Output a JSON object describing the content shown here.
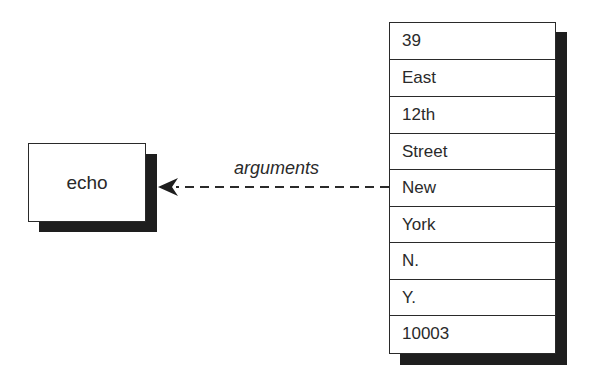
{
  "diagram": {
    "process": {
      "label": "echo"
    },
    "edge": {
      "label": "arguments",
      "style": "dashed",
      "direction": "from-list-to-process"
    },
    "argument_list": {
      "items": [
        "39",
        "East",
        "12th",
        "Street",
        "New",
        "York",
        "N.",
        "Y.",
        "10003"
      ]
    },
    "colors": {
      "stroke": "#2a2a2a",
      "shadow": "#1e1e1e",
      "fill": "#ffffff"
    }
  }
}
